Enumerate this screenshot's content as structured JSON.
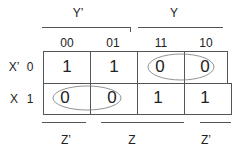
{
  "kmap": {
    "group_labels": {
      "y_prime": "Y’",
      "y": "Y"
    },
    "columns": [
      "00",
      "01",
      "11",
      "10"
    ],
    "rows": [
      {
        "var": "X’",
        "value": "0",
        "cells": [
          "1",
          "1",
          "0",
          "0"
        ]
      },
      {
        "var": "X",
        "value": "1",
        "cells": [
          "0",
          "0",
          "1",
          "1"
        ]
      }
    ],
    "bottom_labels": {
      "z_prime_left": "Z’",
      "z": "Z",
      "z_prime_right": "Z’"
    },
    "groupings": [
      {
        "row": 0,
        "cols": [
          2,
          3
        ],
        "value": "0"
      },
      {
        "row": 1,
        "cols": [
          0,
          1
        ],
        "value": "0"
      }
    ]
  }
}
